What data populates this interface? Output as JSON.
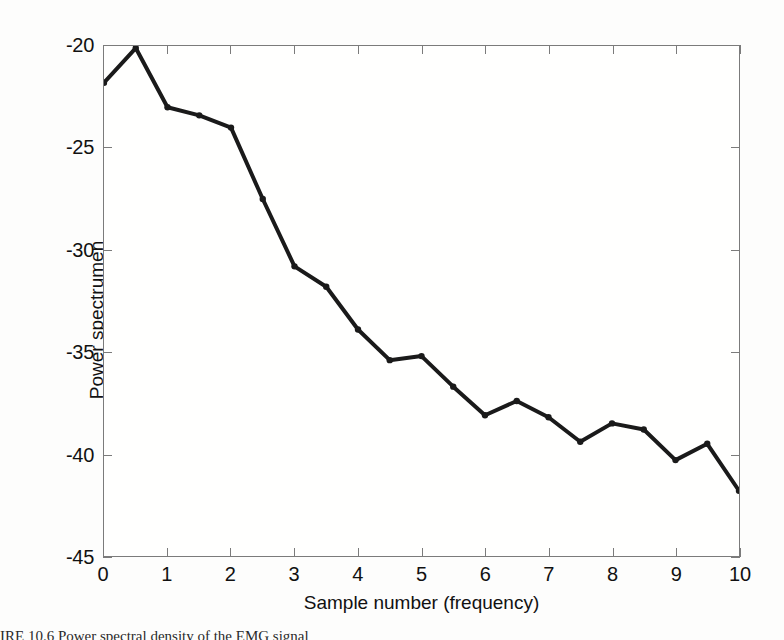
{
  "figure": {
    "caption": "IRE 10.6   Power spectral density of the EMG signal",
    "background_color": "#fdfdfc",
    "line_color": "#1a1a1a",
    "axis_color": "#7b7b7b"
  },
  "chart_data": {
    "type": "line",
    "title": "",
    "xlabel": "Sample number (frequency)",
    "ylabel": "Power spectrumen",
    "xlim": [
      0,
      10
    ],
    "ylim": [
      -45,
      -20
    ],
    "grid": false,
    "legend": null,
    "xticks": [
      "0",
      "1",
      "2",
      "3",
      "4",
      "5",
      "6",
      "7",
      "8",
      "9",
      "10"
    ],
    "xtick_values": [
      0,
      1,
      2,
      3,
      4,
      5,
      6,
      7,
      8,
      9,
      10
    ],
    "yticks": [
      "-20",
      "-25",
      "-30",
      "-35",
      "-40",
      "-45"
    ],
    "ytick_values": [
      -20,
      -25,
      -30,
      -35,
      -40,
      -45
    ],
    "x": [
      0,
      0.5,
      1,
      1.5,
      2,
      2.5,
      3,
      3.5,
      4,
      4.5,
      5,
      5.5,
      6,
      6.5,
      7,
      7.5,
      8,
      8.5,
      9,
      9.5,
      10
    ],
    "values": [
      -21.8,
      -20.1,
      -23.0,
      -23.4,
      -24.0,
      -27.5,
      -30.8,
      -31.8,
      -33.9,
      -35.4,
      -35.2,
      -36.7,
      -38.1,
      -37.4,
      -38.2,
      -39.4,
      -38.5,
      -38.8,
      -40.3,
      -39.5,
      -41.8
    ],
    "marker": "dot",
    "line_width": 4
  }
}
